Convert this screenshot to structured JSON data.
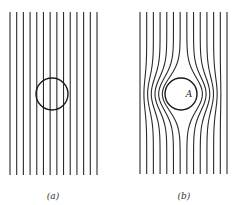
{
  "figure": {
    "width": 233,
    "height": 205,
    "line_color": "#2b2b2b",
    "circle_color": "#1a1a1a",
    "panels": [
      {
        "id": "a",
        "caption": "(a)",
        "caption_pos": [
          53,
          199
        ],
        "description": "Uniform parallel field lines with circle overlaid (no distortion)",
        "line_count": 14,
        "x_start": 10,
        "x_end": 97,
        "y_top": 12,
        "y_bottom": 175,
        "circle": {
          "cx": 52,
          "cy": 94,
          "r": 16
        },
        "distorted": false,
        "point_label": ""
      },
      {
        "id": "b",
        "caption": "(b)",
        "caption_pos": [
          184,
          199
        ],
        "description": "Field lines bending around circular region A (lines excluded from circle)",
        "line_count": 14,
        "x_start": 140,
        "x_end": 227,
        "y_top": 12,
        "y_bottom": 175,
        "circle": {
          "cx": 181,
          "cy": 94,
          "r": 16
        },
        "distorted": true,
        "point_label": "A",
        "point_label_pos": [
          189,
          97
        ]
      }
    ]
  }
}
